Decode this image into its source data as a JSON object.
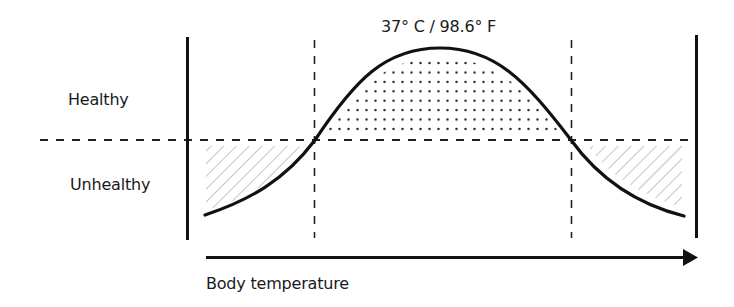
{
  "labels": {
    "healthy": "Healthy",
    "unhealthy": "Unhealthy",
    "peak": "37° C / 98.6° F",
    "x_axis": "Body temperature"
  },
  "diagram": {
    "type": "bell-curve-threshold",
    "threshold_line": "dashed horizontal separating Healthy (above) from Unhealthy (below)",
    "regions": [
      {
        "name": "healthy-range",
        "pattern": "dotted",
        "position": "under curve peak, above threshold"
      },
      {
        "name": "unhealthy-low",
        "pattern": "hatched",
        "position": "left tail, below threshold"
      },
      {
        "name": "unhealthy-high",
        "pattern": "hatched",
        "position": "right tail, below threshold"
      }
    ],
    "colors": {
      "stroke": "#111111",
      "hatch": "#9a9a9a",
      "dots": "#222222",
      "background": "#ffffff"
    }
  }
}
